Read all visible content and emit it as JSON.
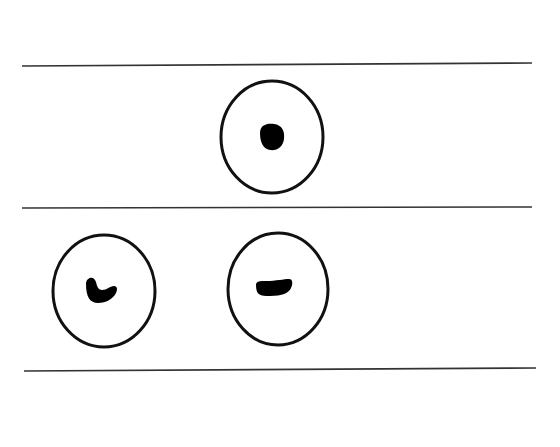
{
  "diagram": {
    "background": "#ffffff",
    "stroke_color": "#111111",
    "lines": [
      {
        "x1": 22,
        "y1": 66,
        "x2": 532,
        "y2": 63
      },
      {
        "x1": 22,
        "y1": 208,
        "x2": 532,
        "y2": 207
      },
      {
        "x1": 24,
        "y1": 371,
        "x2": 536,
        "y2": 368
      }
    ],
    "rows": [
      {
        "cells": [
          {
            "cx": 272,
            "cy": 137,
            "rx": 51,
            "ry": 56,
            "mark": "dot"
          }
        ]
      },
      {
        "cells": [
          {
            "cx": 104,
            "cy": 291,
            "rx": 51,
            "ry": 56,
            "mark": "hook"
          },
          {
            "cx": 278,
            "cy": 289,
            "rx": 50,
            "ry": 56,
            "mark": "dash"
          }
        ]
      }
    ]
  }
}
